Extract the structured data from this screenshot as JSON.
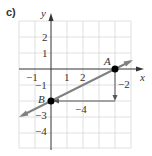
{
  "figure": {
    "part_label": "c)",
    "x_axis_label": "x",
    "y_axis_label": "y",
    "x_ticks": [
      "−1",
      "1",
      "2"
    ],
    "y_ticks": [
      "2",
      "1",
      "−1",
      "−3",
      "−4"
    ],
    "point_a": {
      "label": "A",
      "x": 4,
      "y": 0
    },
    "point_b": {
      "label": "B",
      "x": 0,
      "y": -2
    },
    "rise_label": "−2",
    "run_label": "−4",
    "colors": {
      "line": "#808080",
      "grid": "#d8d8d8",
      "axis": "#333333",
      "point": "#000000"
    }
  }
}
